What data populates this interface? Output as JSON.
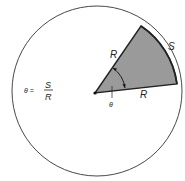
{
  "diagram": {
    "formula": {
      "lhs": "θ =",
      "numerator": "S",
      "denominator": "R"
    },
    "labels": {
      "radius_upper": "R",
      "radius_lower": "R",
      "arc": "S",
      "angle": "θ"
    },
    "colors": {
      "sector_fill": "#9a9a9a",
      "stroke": "#222222",
      "background": "#ffffff"
    }
  }
}
